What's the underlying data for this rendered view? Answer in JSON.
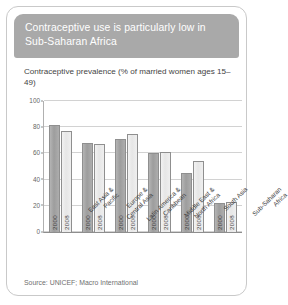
{
  "card": {
    "header_title": "Contraceptive use is particularly low in Sub-Saharan Africa",
    "subtitle": "Contraceptive prevalence (% of married women ages 15–49)",
    "source": "Source: UNICEF; Macro International"
  },
  "colors": {
    "header_bg": "#a9a9a9",
    "header_text": "#ffffff",
    "bar_2000": "#9d9d9d",
    "bar_2008": "#ececec",
    "bar_outline": "#8f8f8f",
    "gridline": "#d2d2d2",
    "card_border": "#c9c9c9",
    "background": "#ffffff"
  },
  "chart_data": {
    "type": "bar",
    "title": "Contraceptive prevalence (% of married women ages 15–49)",
    "xlabel": "",
    "ylabel": "",
    "ylim": [
      0,
      100
    ],
    "yticks": [
      0,
      20,
      40,
      60,
      80,
      100
    ],
    "grid": true,
    "legend_position": "none",
    "categories": [
      "East Asia &\nPacific",
      "Europe &\nCentral Asia",
      "Latin America &\nCaribbean",
      "Middle East &\nNorth Africa",
      "South Asia",
      "Sub-Saharan\nAfrica"
    ],
    "series": [
      {
        "name": "2000",
        "values": [
          82,
          68,
          71,
          60,
          45,
          22
        ]
      },
      {
        "name": "2008",
        "values": [
          77,
          67,
          75,
          61,
          54,
          23
        ]
      }
    ]
  }
}
